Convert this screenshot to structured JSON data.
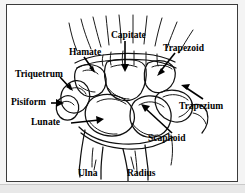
{
  "figure": {
    "frame_color": "#3b3b3b",
    "background_color": "#ffffff",
    "page_background": "#f4f4f4",
    "ink_color": "#111111"
  },
  "labels": [
    {
      "id": "hamate",
      "text": "Hamate",
      "left": 62,
      "top": 42
    },
    {
      "id": "capitate",
      "text": "Capitate",
      "left": 104,
      "top": 25
    },
    {
      "id": "trapezoid",
      "text": "Trapezoid",
      "left": 156,
      "top": 38
    },
    {
      "id": "triquetrum",
      "text": "Triquetrum",
      "left": 16,
      "top": 64
    },
    {
      "id": "pisiform",
      "text": "Pisiform",
      "left": 24,
      "top": 91
    },
    {
      "id": "trapezium",
      "text": "Trapezium",
      "left": 178,
      "top": 95
    },
    {
      "id": "lunate",
      "text": "Lunate",
      "left": 44,
      "top": 113
    },
    {
      "id": "scaphoid",
      "text": "Scaphoid",
      "left": 147,
      "top": 125
    },
    {
      "id": "ulna",
      "text": "Ulna",
      "left": 76,
      "top": 167
    },
    {
      "id": "radius",
      "text": "Radius",
      "left": 125,
      "top": 167
    }
  ],
  "bones": [
    {
      "id": "hamate",
      "name": "Hamate"
    },
    {
      "id": "capitate",
      "name": "Capitate"
    },
    {
      "id": "trapezoid",
      "name": "Trapezoid"
    },
    {
      "id": "trapezium",
      "name": "Trapezium"
    },
    {
      "id": "triquetrum",
      "name": "Triquetrum"
    },
    {
      "id": "pisiform",
      "name": "Pisiform"
    },
    {
      "id": "lunate",
      "name": "Lunate"
    },
    {
      "id": "scaphoid",
      "name": "Scaphoid"
    },
    {
      "id": "ulna",
      "name": "Ulna"
    },
    {
      "id": "radius",
      "name": "Radius"
    }
  ],
  "metacarpal_count": 8
}
